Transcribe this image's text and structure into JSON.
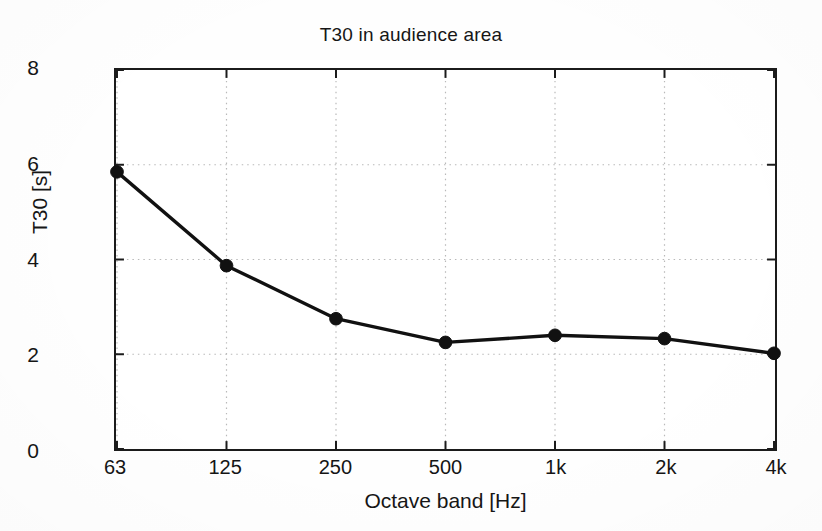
{
  "chart_data": {
    "type": "line",
    "title": "T30 in audience area",
    "xlabel": "Octave band [Hz]",
    "ylabel": "T30 [s]",
    "categories": [
      "63",
      "125",
      "250",
      "500",
      "1k",
      "2k",
      "4k"
    ],
    "values": [
      5.85,
      3.87,
      2.75,
      2.25,
      2.4,
      2.33,
      2.02
    ],
    "series": [
      {
        "name": "T30",
        "values": [
          5.85,
          3.87,
          2.75,
          2.25,
          2.4,
          2.33,
          2.02
        ]
      }
    ],
    "ylim": [
      0,
      8
    ],
    "yticks": [
      "0",
      "2",
      "4",
      "6",
      "8"
    ],
    "ytick_values": [
      0,
      2,
      4,
      6,
      8
    ],
    "xticks": [
      "63",
      "125",
      "250",
      "500",
      "1k",
      "2k",
      "4k"
    ],
    "grid": true,
    "grid_style": "dotted",
    "legend": null,
    "legend_position": "none",
    "marker": "filled-circle",
    "line_color": "#111111",
    "marker_color": "#111111",
    "grid_color": "#b9b9b9",
    "axis_color": "#1b1b1b",
    "background_color": "#ffffff"
  }
}
